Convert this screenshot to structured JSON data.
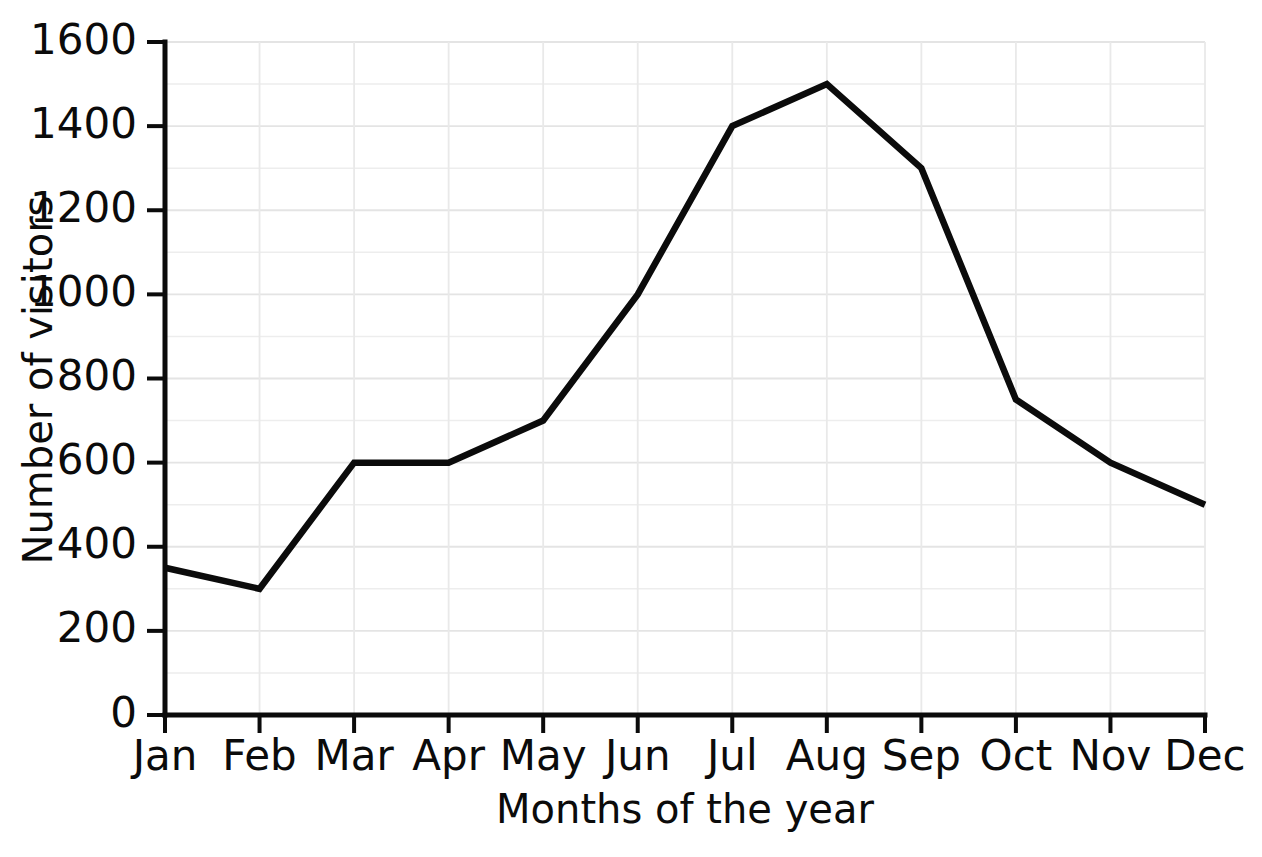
{
  "chart_data": {
    "type": "line",
    "title": "",
    "subtitle": "",
    "xlabel": "Months of the year",
    "ylabel": "Number of visitors",
    "categories": [
      "Jan",
      "Feb",
      "Mar",
      "Apr",
      "May",
      "Jun",
      "Jul",
      "Aug",
      "Sep",
      "Oct",
      "Nov",
      "Dec"
    ],
    "values": [
      350,
      300,
      600,
      600,
      700,
      1000,
      1400,
      1500,
      1300,
      750,
      600,
      500
    ],
    "series": [
      {
        "name": "Number of visitors",
        "values": [
          350,
          300,
          600,
          600,
          700,
          1000,
          1400,
          1500,
          1300,
          750,
          600,
          500
        ]
      }
    ],
    "ylim": [
      0,
      1600
    ],
    "y_major_ticks": [
      0,
      200,
      400,
      600,
      800,
      1000,
      1200,
      1400,
      1600
    ],
    "y_major_tick_labels": [
      "0",
      "200",
      "400",
      "600",
      "800",
      "1000",
      "1200",
      "1400",
      "1600"
    ],
    "y_minor_step": 100,
    "grid": true,
    "grid_color": "#ebebeb",
    "legend": false,
    "legend_position": "none",
    "line_color": "#0b0b0b",
    "markers": false,
    "annotations": []
  },
  "axes": {
    "y": {
      "label": "Number of visitors",
      "ticks": [
        {
          "value": 0,
          "label": "0"
        },
        {
          "value": 200,
          "label": "200"
        },
        {
          "value": 400,
          "label": "400"
        },
        {
          "value": 600,
          "label": "600"
        },
        {
          "value": 800,
          "label": "800"
        },
        {
          "value": 1000,
          "label": "1000"
        },
        {
          "value": 1200,
          "label": "1200"
        },
        {
          "value": 1400,
          "label": "1400"
        },
        {
          "value": 1600,
          "label": "1600"
        }
      ]
    },
    "x": {
      "label": "Months of the year",
      "ticks": [
        {
          "value": 0,
          "label": "Jan"
        },
        {
          "value": 1,
          "label": "Feb"
        },
        {
          "value": 2,
          "label": "Mar"
        },
        {
          "value": 3,
          "label": "Apr"
        },
        {
          "value": 4,
          "label": "May"
        },
        {
          "value": 5,
          "label": "Jun"
        },
        {
          "value": 6,
          "label": "Jul"
        },
        {
          "value": 7,
          "label": "Aug"
        },
        {
          "value": 8,
          "label": "Sep"
        },
        {
          "value": 9,
          "label": "Oct"
        },
        {
          "value": 10,
          "label": "Nov"
        },
        {
          "value": 11,
          "label": "Dec"
        }
      ]
    }
  }
}
